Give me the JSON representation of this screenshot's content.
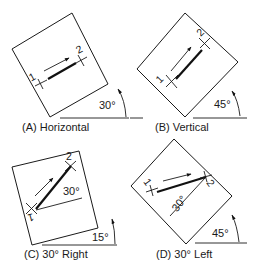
{
  "figure": {
    "panels": [
      {
        "id": "A",
        "caption": "(A) Horizontal",
        "plate_rotation_label": "30°",
        "point_labels": [
          "1",
          "2"
        ],
        "line_angle_label": ""
      },
      {
        "id": "B",
        "caption": "(B) Vertical",
        "plate_rotation_label": "45°",
        "point_labels": [
          "1",
          "2"
        ],
        "line_angle_label": ""
      },
      {
        "id": "C",
        "caption": "(C) 30° Right",
        "plate_rotation_label": "15°",
        "point_labels": [
          "1",
          "2"
        ],
        "line_angle_label": "30°"
      },
      {
        "id": "D",
        "caption": "(D) 30° Left",
        "plate_rotation_label": "45°",
        "point_labels": [
          "1",
          "2"
        ],
        "line_angle_label": "30°"
      }
    ],
    "colors": {
      "ink": "#1a1a1a",
      "background": "#ffffff"
    }
  }
}
